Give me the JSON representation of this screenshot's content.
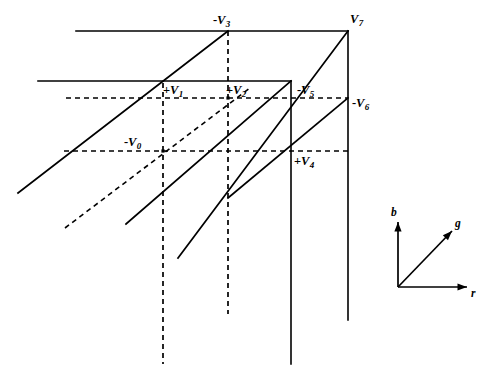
{
  "figure": {
    "background_color": "#ffffff",
    "stroke_color": "#000000",
    "width": 496,
    "height": 389
  },
  "vertices": [
    {
      "id": "v0",
      "sign": "-",
      "symbol": "V",
      "subscript": "0",
      "label": "-V0",
      "x": 163,
      "y": 151,
      "label_x": 124,
      "label_y": 136
    },
    {
      "id": "v1",
      "sign": "+",
      "symbol": "V",
      "subscript": "1",
      "label": "+V1",
      "x": 163,
      "y": 98,
      "label_x": 163,
      "label_y": 84
    },
    {
      "id": "v2",
      "sign": "+",
      "symbol": "V",
      "subscript": "2",
      "label": "+V2",
      "x": 228,
      "y": 98,
      "label_x": 226,
      "label_y": 84
    },
    {
      "id": "v3",
      "sign": "-",
      "symbol": "V",
      "subscript": "3",
      "label": "-V3",
      "x": 228,
      "y": 31,
      "label_x": 213,
      "label_y": 14
    },
    {
      "id": "v4",
      "sign": "+",
      "symbol": "V",
      "subscript": "4",
      "label": "+V4",
      "x": 291,
      "y": 151,
      "label_x": 294,
      "label_y": 155
    },
    {
      "id": "v5",
      "sign": "-",
      "symbol": "V",
      "subscript": "5",
      "label": "-V5",
      "x": 291,
      "y": 81,
      "label_x": 297,
      "label_y": 84
    },
    {
      "id": "v6",
      "sign": "-",
      "symbol": "V",
      "subscript": "6",
      "label": "-V6",
      "x": 348,
      "y": 98,
      "label_x": 352,
      "label_y": 97
    },
    {
      "id": "v7",
      "sign": "",
      "symbol": "V",
      "subscript": "7",
      "label": "V7",
      "x": 348,
      "y": 31,
      "label_x": 350,
      "label_y": 13
    }
  ],
  "axes_legend": {
    "origin": {
      "x": 398,
      "y": 287
    },
    "arrows": [
      {
        "id": "axis-b",
        "label": "b",
        "x2": 398,
        "y2": 222,
        "label_x": 391,
        "label_y": 207
      },
      {
        "id": "axis-g",
        "label": "g",
        "x2": 452,
        "y2": 231,
        "label_x": 455,
        "label_y": 218
      },
      {
        "id": "axis-r",
        "label": "r",
        "x2": 467,
        "y2": 287,
        "label_x": 471,
        "label_y": 288
      }
    ]
  },
  "edges": {
    "solid_horizontal": [
      {
        "id": "top-back-edge",
        "x1": 76,
        "y1": 31,
        "x2": 348,
        "y2": 31
      },
      {
        "id": "front-top-edge",
        "x1": 38,
        "y1": 81,
        "x2": 291,
        "y2": 81
      }
    ],
    "dashed_horizontal": [
      {
        "id": "hidden-upper-edge",
        "x1": 66,
        "y1": 98,
        "x2": 348,
        "y2": 98
      },
      {
        "id": "hidden-lower-edge",
        "x1": 64,
        "y1": 151,
        "x2": 348,
        "y2": 151
      }
    ],
    "solid_vertical": [
      {
        "id": "vertical-v5-v4",
        "x1": 291,
        "y1": 81,
        "x2": 291,
        "y2": 364
      },
      {
        "id": "vertical-v7-v6",
        "x1": 348,
        "y1": 31,
        "x2": 348,
        "y2": 320
      }
    ],
    "dashed_vertical": [
      {
        "id": "vertical-v1-v0",
        "x1": 163,
        "y1": 83,
        "x2": 163,
        "y2": 364
      },
      {
        "id": "vertical-v3-v2",
        "x1": 228,
        "y1": 31,
        "x2": 228,
        "y2": 314
      }
    ],
    "solid_diagonal": [
      {
        "id": "diagonal-through-v1-v3",
        "x1": 18,
        "y1": 193,
        "x2": 228,
        "y2": 31
      },
      {
        "id": "diagonal-through-v0-v2",
        "x1": 126,
        "y1": 224,
        "x2": 291,
        "y2": 81
      },
      {
        "id": "diagonal-through-v4-v7",
        "x1": 178,
        "y1": 258,
        "x2": 348,
        "y2": 31
      },
      {
        "id": "diagonal-through-v4-v6",
        "x1": 228,
        "y1": 198,
        "x2": 348,
        "y2": 98
      }
    ],
    "dashed_diagonal": [
      {
        "id": "hidden-diagonal-v0-v2",
        "x1": 65,
        "y1": 228,
        "x2": 250,
        "y2": 88
      }
    ]
  }
}
